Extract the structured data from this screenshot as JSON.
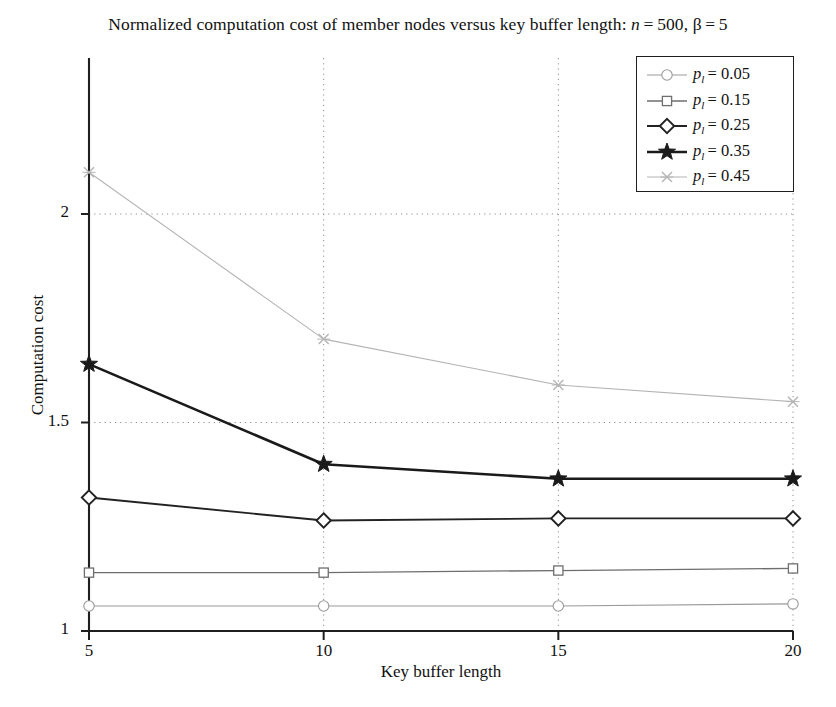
{
  "chart_data": {
    "type": "line",
    "title_plain": "Normalized computation cost of member nodes versus key buffer length: n = 500, beta = 5",
    "xlabel": "Key buffer length",
    "ylabel": "Computation cost",
    "x": [
      5,
      10,
      15,
      20
    ],
    "xtick_labels": [
      "5",
      "10",
      "15",
      "20"
    ],
    "ytick_labels": [
      "1",
      "1.5",
      "2"
    ],
    "yticks": [
      1,
      1.5,
      2
    ],
    "xlim": [
      5,
      20
    ],
    "ylim": [
      1,
      2.2
    ],
    "grid": "dotted",
    "legend_position": "top-right",
    "series": [
      {
        "name": "p_l = 0.05",
        "label_prefix": "p",
        "label_sub": "l",
        "label_value": "= 0.05",
        "marker": "circle",
        "color": "#9a9a9a",
        "width": 1.1,
        "values": [
          1.06,
          1.06,
          1.06,
          1.065
        ]
      },
      {
        "name": "p_l = 0.15",
        "label_prefix": "p",
        "label_sub": "l",
        "label_value": "= 0.15",
        "marker": "square",
        "color": "#6e6e6e",
        "width": 1.3,
        "values": [
          1.14,
          1.14,
          1.145,
          1.15
        ]
      },
      {
        "name": "p_l = 0.25",
        "label_prefix": "p",
        "label_sub": "l",
        "label_value": "= 0.25",
        "marker": "diamond",
        "color": "#222222",
        "width": 1.9,
        "values": [
          1.32,
          1.265,
          1.27,
          1.27
        ]
      },
      {
        "name": "p_l = 0.35",
        "label_prefix": "p",
        "label_sub": "l",
        "label_value": "= 0.35",
        "marker": "star",
        "color": "#1a1a1a",
        "width": 2.6,
        "values": [
          1.64,
          1.4,
          1.365,
          1.365
        ]
      },
      {
        "name": "p_l = 0.45",
        "label_prefix": "p",
        "label_sub": "l",
        "label_value": "= 0.45",
        "marker": "x",
        "color": "#b4b4b4",
        "width": 1.1,
        "values": [
          2.1,
          1.7,
          1.59,
          1.55
        ]
      }
    ]
  },
  "axes": {
    "y_ticks": [
      {
        "label": "2",
        "value": 2
      },
      {
        "label": "1.5",
        "value": 1.5
      },
      {
        "label": "1",
        "value": 1
      }
    ],
    "x_ticks": [
      {
        "label": "5",
        "value": 5
      },
      {
        "label": "10",
        "value": 10
      },
      {
        "label": "15",
        "value": 15
      },
      {
        "label": "20",
        "value": 20
      }
    ]
  },
  "colors": {
    "axis": "#1f1f1f",
    "grid": "#8d8d8d",
    "background": "#ffffff",
    "text": "#111111"
  }
}
